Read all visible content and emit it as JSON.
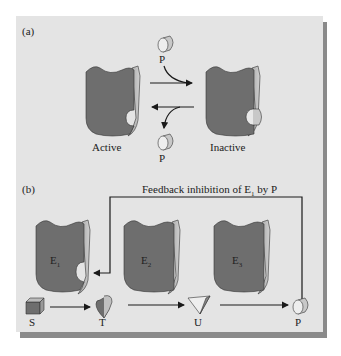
{
  "panel_a": {
    "label": "(a)",
    "active_label": "Active",
    "inactive_label": "Inactive",
    "p_top": "P",
    "p_bottom": "P"
  },
  "panel_b": {
    "label": "(b)",
    "feedback_text": "Feedback inhibition of E",
    "feedback_sub": "1",
    "feedback_tail": " by P",
    "enzymes": [
      {
        "label": "E",
        "sub": "1"
      },
      {
        "label": "E",
        "sub": "2"
      },
      {
        "label": "E",
        "sub": "3"
      }
    ],
    "metabolites": [
      "S",
      "T",
      "U",
      "P"
    ]
  },
  "colors": {
    "background": "#e4e4e4",
    "shadow": "#8a8a8a",
    "enzyme_fill": "#6e6e6e",
    "enzyme_side": "#b8b8b8",
    "line": "#1a1a1a"
  }
}
